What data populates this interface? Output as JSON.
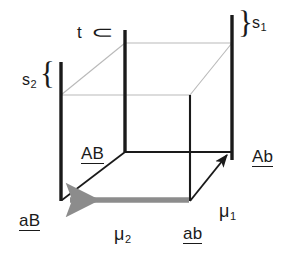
{
  "figure": {
    "background_color": "#ffffff",
    "line_color_front": "#1a1a1a",
    "line_color_back": "#b9b9b9",
    "arrow_color_gray": "#8c8c8c"
  },
  "labels": {
    "t": "t",
    "s1_base": "s",
    "s1_sub": "1",
    "s2_base": "s",
    "s2_sub": "2",
    "AB": "AB",
    "Ab": "Ab",
    "aB": "aB",
    "ab": "ab",
    "mu1_base": "μ",
    "mu1_sub": "1",
    "mu2_base": "μ",
    "mu2_sub": "2"
  },
  "braces": {
    "t_brace": "⊂",
    "s1_brace": "}",
    "s2_brace": "{"
  },
  "geometry": {
    "bars": [
      {
        "name": "bar-left-front",
        "x": 61,
        "y1": 62,
        "y2": 201
      },
      {
        "name": "bar-mid-back",
        "x": 125,
        "y1": 30,
        "y2": 152
      },
      {
        "name": "bar-right-back",
        "x": 232,
        "y1": 15,
        "y2": 160
      }
    ],
    "front_edges": [
      {
        "name": "edge-front-vertical-right",
        "x1": 190,
        "y1": 95,
        "x2": 190,
        "y2": 201
      },
      {
        "name": "edge-top-front",
        "x1": 125,
        "y1": 152,
        "x2": 232,
        "y2": 152
      },
      {
        "name": "edge-diagonal-AB",
        "x1": 61,
        "y1": 201,
        "x2": 125,
        "y2": 152
      }
    ],
    "back_edges": [
      {
        "name": "edge-back-top",
        "x1": 125,
        "y1": 43,
        "x2": 232,
        "y2": 43
      },
      {
        "name": "edge-back-left-diag",
        "x1": 61,
        "y1": 95,
        "x2": 125,
        "y2": 43
      },
      {
        "name": "edge-back-right-diag",
        "x1": 190,
        "y1": 95,
        "x2": 232,
        "y2": 43
      },
      {
        "name": "edge-back-bottom",
        "x1": 61,
        "y1": 95,
        "x2": 190,
        "y2": 95
      }
    ],
    "arrows": [
      {
        "name": "arrow-mu1",
        "x1": 190,
        "y1": 201,
        "x2": 229,
        "y2": 153,
        "color": "#1a1a1a"
      },
      {
        "name": "arrow-mu2",
        "x1": 190,
        "y1": 200,
        "x2": 64,
        "y2": 200,
        "color": "#8c8c8c"
      }
    ]
  }
}
